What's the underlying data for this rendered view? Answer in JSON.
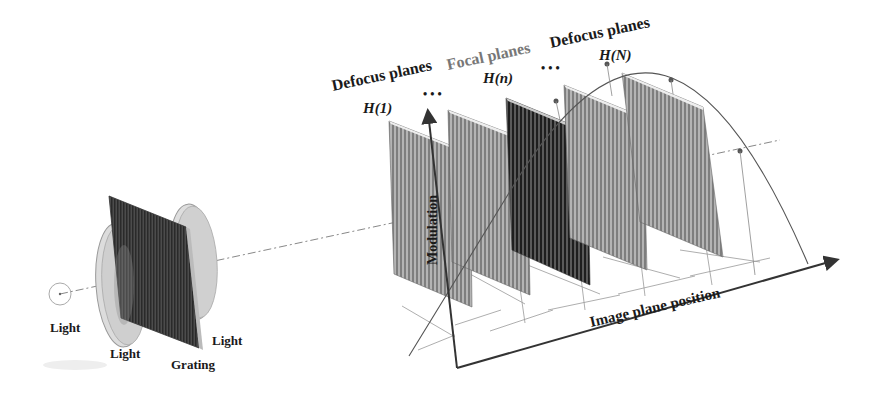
{
  "diagram": {
    "title_labels": {
      "defocus_left": "Defocus planes",
      "focal": "Focal planes",
      "defocus_right": "Defocus planes",
      "h1": "H(1)",
      "hn": "H(n)",
      "hN": "H(N)",
      "ellipsis1": "• • •",
      "ellipsis2": "• • •"
    },
    "optics_labels": {
      "source": "Light",
      "lens1": "Light",
      "grating": "Grating",
      "lens2": "Light"
    },
    "axes": {
      "y_label": "Modulation",
      "x_label": "Image plane position"
    },
    "colors": {
      "plane_light": "#9a9a9a",
      "plane_dark": "#3c3c3c",
      "lens_fill": "#d8d8d8",
      "axis": "#333333",
      "focal_label": "#777777"
    },
    "planes": [
      {
        "name": "defocus-plane-1",
        "shade": "light"
      },
      {
        "name": "defocus-plane-2",
        "shade": "light"
      },
      {
        "name": "focal-plane",
        "shade": "dark"
      },
      {
        "name": "defocus-plane-4",
        "shade": "light"
      },
      {
        "name": "defocus-plane-N",
        "shade": "light"
      }
    ]
  }
}
